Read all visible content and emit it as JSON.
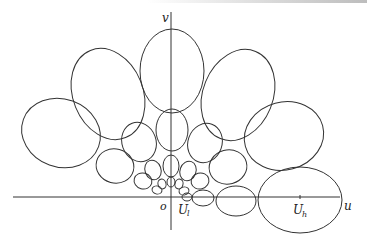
{
  "figure": {
    "labels": {
      "v_axis": "v",
      "u_axis": "u",
      "origin": "o",
      "ul": "U",
      "ul_sub": "l",
      "uh": "U",
      "uh_sub": "h"
    },
    "colors": {
      "stroke": "#333333",
      "background": "#ffffff"
    },
    "axes": {
      "u": {
        "x1": 13,
        "y1": 197,
        "x2": 340,
        "y2": 197
      },
      "v": {
        "x1": 171,
        "y1": 12,
        "x2": 171,
        "y2": 230
      }
    },
    "ellipses": [
      {
        "name": "top-center",
        "cx": 172,
        "cy": 71,
        "rx": 32,
        "ry": 42,
        "rot": 0
      },
      {
        "name": "upper-left",
        "cx": 108,
        "cy": 94,
        "rx": 35,
        "ry": 47,
        "rot": -22
      },
      {
        "name": "upper-right",
        "cx": 238,
        "cy": 95,
        "rx": 35,
        "ry": 47,
        "rot": 22
      },
      {
        "name": "far-left",
        "cx": 61,
        "cy": 133,
        "rx": 40,
        "ry": 34,
        "rot": 20
      },
      {
        "name": "far-right",
        "cx": 284,
        "cy": 136,
        "rx": 40,
        "ry": 34,
        "rot": -15
      },
      {
        "name": "center-mid",
        "cx": 172,
        "cy": 130,
        "rx": 16,
        "ry": 21,
        "rot": 0
      },
      {
        "name": "mid-left",
        "cx": 139,
        "cy": 142,
        "rx": 17,
        "ry": 20,
        "rot": -20
      },
      {
        "name": "mid-right",
        "cx": 205,
        "cy": 143,
        "rx": 17,
        "ry": 20,
        "rot": 20
      },
      {
        "name": "low-left",
        "cx": 115,
        "cy": 166,
        "rx": 19,
        "ry": 17,
        "rot": 15
      },
      {
        "name": "low-right",
        "cx": 228,
        "cy": 167,
        "rx": 19,
        "ry": 17,
        "rot": -15
      },
      {
        "name": "center-small",
        "cx": 171,
        "cy": 166,
        "rx": 8,
        "ry": 11,
        "rot": 0
      },
      {
        "name": "left-small",
        "cx": 153,
        "cy": 170,
        "rx": 8,
        "ry": 10,
        "rot": -20
      },
      {
        "name": "right-small",
        "cx": 188,
        "cy": 171,
        "rx": 8,
        "ry": 10,
        "rot": 20
      },
      {
        "name": "left-tiny-1",
        "cx": 143,
        "cy": 181,
        "rx": 9,
        "ry": 8,
        "rot": 15
      },
      {
        "name": "right-tiny-1",
        "cx": 200,
        "cy": 181,
        "rx": 9,
        "ry": 8,
        "rot": -15
      },
      {
        "name": "center-tiny",
        "cx": 171,
        "cy": 182,
        "rx": 4,
        "ry": 5,
        "rot": 0
      },
      {
        "name": "left-tiny-2",
        "cx": 162,
        "cy": 184,
        "rx": 4,
        "ry": 5,
        "rot": -15
      },
      {
        "name": "right-tiny-2",
        "cx": 179,
        "cy": 184,
        "rx": 4,
        "ry": 5,
        "rot": 15
      },
      {
        "name": "left-tiny-3",
        "cx": 157,
        "cy": 190,
        "rx": 5,
        "ry": 4,
        "rot": 15
      },
      {
        "name": "right-tiny-3",
        "cx": 184,
        "cy": 191,
        "rx": 5,
        "ry": 4,
        "rot": -15
      },
      {
        "name": "ul-ellipse",
        "cx": 187,
        "cy": 197,
        "rx": 5,
        "ry": 4,
        "rot": 0
      },
      {
        "name": "bottom-chain-1",
        "cx": 203,
        "cy": 198,
        "rx": 11,
        "ry": 8,
        "rot": 0
      },
      {
        "name": "bottom-chain-2",
        "cx": 236,
        "cy": 201,
        "rx": 20,
        "ry": 15,
        "rot": 0
      },
      {
        "name": "bottom-big-right",
        "cx": 300,
        "cy": 200,
        "rx": 42,
        "ry": 33,
        "rot": 0
      }
    ],
    "ticks": [
      {
        "name": "uh-tick",
        "x": 300,
        "y1": 195,
        "y2": 199
      }
    ]
  }
}
